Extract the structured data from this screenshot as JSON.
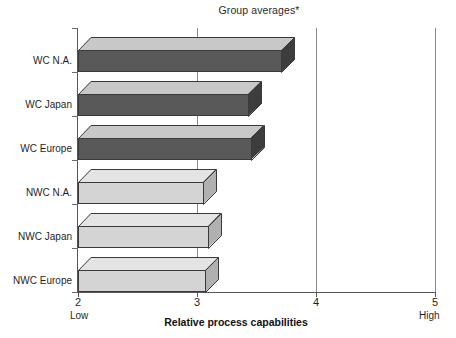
{
  "chart_data": {
    "type": "bar",
    "orientation": "horizontal",
    "style": "3d-bar",
    "title": "Group averages*",
    "xlabel": "Relative process capabilities",
    "ylabel": "",
    "xlim": [
      2,
      5
    ],
    "xticks": [
      2,
      3,
      4,
      5
    ],
    "xtick_labels": [
      "2",
      "3",
      "4",
      "5"
    ],
    "x_low_label": "Low",
    "x_high_label": "High",
    "grid": "vertical gridlines at x = 3, 4, 5",
    "legend": "none",
    "categories": [
      "WC N.A.",
      "WC Japan",
      "WC Europe",
      "NWC N.A.",
      "NWC Japan",
      "NWC Europe"
    ],
    "values": [
      3.71,
      3.43,
      3.45,
      3.05,
      3.09,
      3.07
    ],
    "bars": [
      {
        "category": "WC N.A.",
        "value": 3.71,
        "group": "WC",
        "fill": "#595959",
        "top_fill": "#c8c8c8",
        "side_fill": "#3d3d3d"
      },
      {
        "category": "WC Japan",
        "value": 3.43,
        "group": "WC",
        "fill": "#595959",
        "top_fill": "#c8c8c8",
        "side_fill": "#3d3d3d"
      },
      {
        "category": "WC Europe",
        "value": 3.45,
        "group": "WC",
        "fill": "#595959",
        "top_fill": "#c8c8c8",
        "side_fill": "#3d3d3d"
      },
      {
        "category": "NWC N.A.",
        "value": 3.05,
        "group": "NWC",
        "fill": "#d4d4d4",
        "top_fill": "#e4e4e4",
        "side_fill": "#b0b0b0"
      },
      {
        "category": "NWC Japan",
        "value": 3.09,
        "group": "NWC",
        "fill": "#d4d4d4",
        "top_fill": "#e4e4e4",
        "side_fill": "#b0b0b0"
      },
      {
        "category": "NWC Europe",
        "value": 3.07,
        "group": "NWC",
        "fill": "#d4d4d4",
        "top_fill": "#e4e4e4",
        "side_fill": "#b0b0b0"
      }
    ],
    "colors": {
      "wc_front": "#595959",
      "wc_top": "#c8c8c8",
      "wc_side": "#3d3d3d",
      "nwc_front": "#d4d4d4",
      "nwc_top": "#e4e4e4",
      "nwc_side": "#b0b0b0",
      "axis": "#565656",
      "gridline": "#8a8a8a",
      "background": "#ffffff",
      "text": "#1f1f1f"
    }
  },
  "title": {
    "text": "Group averages*"
  },
  "axis": {
    "x_title": "Relative process capabilities",
    "ticks": [
      "2",
      "3",
      "4",
      "5"
    ],
    "low": "Low",
    "high": "High"
  },
  "categories": [
    {
      "label": "WC N.A."
    },
    {
      "label": "WC Japan"
    },
    {
      "label": "WC Europe"
    },
    {
      "label": "NWC N.A."
    },
    {
      "label": "NWC Japan"
    },
    {
      "label": "NWC Europe"
    }
  ]
}
